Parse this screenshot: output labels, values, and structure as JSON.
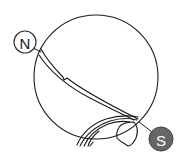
{
  "diagram": {
    "poles": {
      "north": {
        "label": "N",
        "fill": "#ffffff",
        "stroke": "#333333",
        "text_color": "#222222"
      },
      "south": {
        "label": "S",
        "fill": "#666666",
        "stroke": "#444444",
        "text_color": "#ffffff"
      }
    },
    "colors": {
      "line": "#1a1a1a",
      "background": "#ffffff"
    }
  }
}
